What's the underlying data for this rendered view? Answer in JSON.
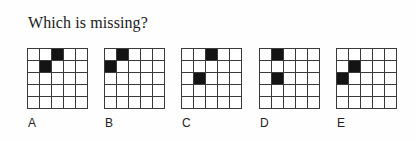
{
  "question": {
    "title": "Which is missing?"
  },
  "grid_size": {
    "rows": 5,
    "cols": 5
  },
  "colors": {
    "filled": "#141414",
    "empty": "#ffffff",
    "line": "#3a3a3a"
  },
  "options": [
    {
      "label": "A",
      "left": 27,
      "filled": [
        [
          0,
          2
        ],
        [
          1,
          1
        ]
      ]
    },
    {
      "label": "B",
      "left": 104,
      "filled": [
        [
          0,
          1
        ],
        [
          1,
          0
        ]
      ]
    },
    {
      "label": "C",
      "left": 181,
      "filled": [
        [
          0,
          2
        ],
        [
          2,
          1
        ]
      ]
    },
    {
      "label": "D",
      "left": 259,
      "filled": [
        [
          0,
          1
        ],
        [
          2,
          1
        ]
      ]
    },
    {
      "label": "E",
      "left": 336,
      "filled": [
        [
          1,
          1
        ],
        [
          2,
          0
        ]
      ]
    }
  ]
}
